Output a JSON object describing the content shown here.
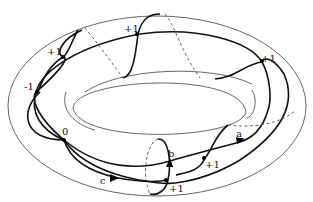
{
  "figure": {
    "colors": {
      "background": "#ffffff",
      "stroke": "#111111",
      "thin_stroke": "#555555"
    }
  },
  "labels": {
    "curve_a": "a",
    "curve_b": "b",
    "curve_c": "c",
    "sign_upper_left": "+1",
    "sign_left": "-1",
    "sign_top": "+1",
    "sign_right": "+1",
    "sign_zero": "0",
    "sign_lower_a": "+1",
    "sign_lower_b": "+1"
  }
}
